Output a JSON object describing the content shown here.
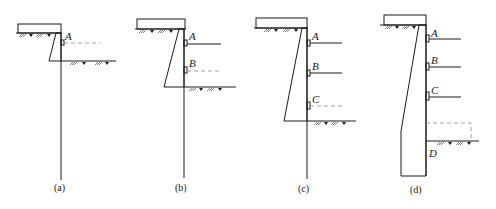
{
  "figure": {
    "panels": [
      {
        "id": "a",
        "caption": "(a)",
        "supports": [
          {
            "label": "A",
            "style": "dashed"
          }
        ],
        "excavation_label": null
      },
      {
        "id": "b",
        "caption": "(b)",
        "supports": [
          {
            "label": "A",
            "style": "solid"
          },
          {
            "label": "B",
            "style": "dashed"
          }
        ],
        "excavation_label": null
      },
      {
        "id": "c",
        "caption": "(c)",
        "supports": [
          {
            "label": "A",
            "style": "solid"
          },
          {
            "label": "B",
            "style": "solid"
          },
          {
            "label": "C",
            "style": "dashed"
          }
        ],
        "excavation_label": null
      },
      {
        "id": "d",
        "caption": "(d)",
        "supports": [
          {
            "label": "A",
            "style": "solid"
          },
          {
            "label": "B",
            "style": "solid"
          },
          {
            "label": "C",
            "style": "solid"
          }
        ],
        "excavation_label": "D"
      }
    ]
  },
  "colors": {
    "line": "#1a1a1a",
    "dashed": "#888888",
    "background": "#ffffff"
  }
}
